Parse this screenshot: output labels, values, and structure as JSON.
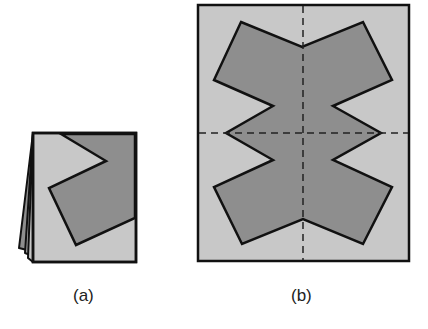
{
  "figure": {
    "panels": [
      {
        "id": "a",
        "caption": "(a)",
        "description": "Folded paper (multiple layers) with a cut-out shape drawn along the fold edges",
        "paper_fill": "#c8c8c8",
        "shape_fill": "#8e8e8e",
        "outline": "#111111"
      },
      {
        "id": "b",
        "caption": "(b)",
        "description": "Unfolded paper showing a symmetric star-like shape with dashed fold lines",
        "paper_fill": "#c8c8c8",
        "shape_fill": "#8e8e8e",
        "outline": "#111111",
        "fold_lines": [
          "vertical",
          "horizontal"
        ]
      }
    ]
  }
}
